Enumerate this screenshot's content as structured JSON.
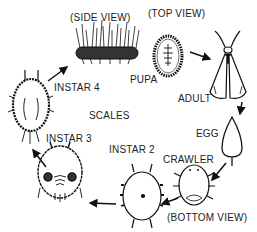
{
  "labels": {
    "side_view": "(SIDE VIEW)",
    "top_view": "(TOP VIEW)",
    "pupa": "PUPA",
    "adult": "ADULT",
    "egg": "EGG",
    "crawler": "CRAWLER",
    "bottom_view": "(BOTTOM VIEW)",
    "instar2": "INSTAR 2",
    "instar3": "INSTAR 3",
    "instar4": "INSTAR 4",
    "center": "SCALES"
  },
  "stages_order": [
    "PUPA (SIDE VIEW)",
    "PUPA (TOP VIEW)",
    "ADULT",
    "EGG",
    "CRAWLER",
    "INSTAR 2",
    "INSTAR 3",
    "INSTAR 4"
  ]
}
